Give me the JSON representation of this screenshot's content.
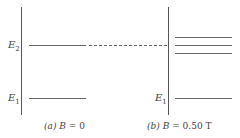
{
  "diagram": {
    "type": "energy-level-diagram",
    "panels": [
      {
        "id": "a",
        "caption_tag": "(a)",
        "caption_var": "B",
        "caption_value": "= 0",
        "levels": [
          {
            "label_main": "E",
            "label_sub": "2",
            "count": 1
          },
          {
            "label_main": "E",
            "label_sub": "1",
            "count": 1
          }
        ]
      },
      {
        "id": "b",
        "caption_tag": "(b)",
        "caption_var": "B",
        "caption_value": "= 0.50 T",
        "levels": [
          {
            "label_main": "",
            "label_sub": "",
            "count": 3,
            "note": "E2 split into three levels"
          },
          {
            "label_main": "E",
            "label_sub": "1",
            "count": 1
          }
        ]
      }
    ],
    "connector": "dashed line from E2 (a) to middle split level (b)"
  }
}
